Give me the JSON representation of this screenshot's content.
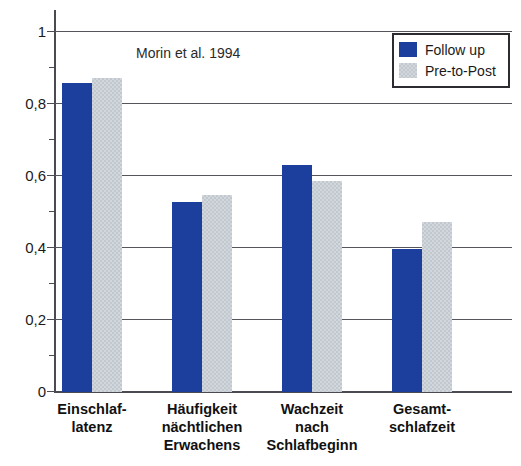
{
  "chart_data": {
    "type": "bar",
    "title": "",
    "annotation": "Morin et al. 1994",
    "xlabel": "",
    "ylabel": "",
    "ylim": [
      0,
      1
    ],
    "y_ticks": [
      "0",
      "0,2",
      "0,4",
      "0,6",
      "0,8",
      "1"
    ],
    "y_tick_values": [
      0,
      0.2,
      0.4,
      0.6,
      0.8,
      1
    ],
    "y_minor_ticks": [
      0.1,
      0.3,
      0.5,
      0.7,
      0.9
    ],
    "grid": true,
    "legend_position": "top-right",
    "categories": [
      "Einschlaf-\nlatenz",
      "Häufigkeit\nnächtlichen\nErwachens",
      "Wachzeit\nnach\nSchlafbeginn",
      "Gesamt-\nschlafzeit"
    ],
    "category_lines": [
      [
        "Einschlaf-",
        "latenz"
      ],
      [
        "Häufigkeit",
        "nächtlichen",
        "Erwachens"
      ],
      [
        "Wachzeit",
        "nach",
        "Schlafbeginn"
      ],
      [
        "Gesamt-",
        "schlafzeit"
      ]
    ],
    "series": [
      {
        "name": "Follow up",
        "color": "#1c3f9e",
        "values": [
          0.855,
          0.525,
          0.63,
          0.395
        ]
      },
      {
        "name": "Pre-to-Post",
        "color": "#d2d7dc",
        "values": [
          0.87,
          0.545,
          0.585,
          0.47
        ]
      }
    ]
  },
  "legend": {
    "items": [
      {
        "label": "Follow up",
        "swatch": "swatch-blue"
      },
      {
        "label": "Pre-to-Post",
        "swatch": "swatch-gray"
      }
    ]
  },
  "colors": {
    "series_follow_up": "#1c3f9e",
    "series_pre_to_post": "#d2d7dc",
    "axis": "#4a4a52",
    "grid": "#55555c",
    "text": "#1a1a1a",
    "background": "#ffffff"
  }
}
